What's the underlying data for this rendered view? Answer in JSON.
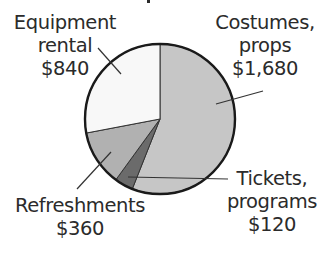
{
  "chart_data": {
    "type": "pie",
    "title": "",
    "total": 3000,
    "start_angle_deg": 0,
    "direction": "clockwise",
    "slices": [
      {
        "name": "Costumes, props",
        "value": 1680,
        "label_lines": [
          "Costumes,",
          "props",
          "$1,680"
        ],
        "color": "#c6c6c6"
      },
      {
        "name": "Tickets, programs",
        "value": 120,
        "label_lines": [
          "Tickets,",
          "programs",
          "$120"
        ],
        "color": "#6b6b6b"
      },
      {
        "name": "Refreshments",
        "value": 360,
        "label_lines": [
          "Refreshments",
          "$360"
        ],
        "color": "#b1b1b1"
      },
      {
        "name": "Equipment rental",
        "value": 840,
        "label_lines": [
          "Equipment",
          "rental",
          "$840"
        ],
        "color": "#f8f8f8"
      }
    ],
    "legend": "none (leader-line labels)",
    "grid": false
  },
  "labels": {
    "equipment": {
      "line1": "Equipment",
      "line2": "rental",
      "line3": "$840"
    },
    "costumes": {
      "line1": "Costumes,",
      "line2": "props",
      "line3": "$1,680"
    },
    "refreshments": {
      "line1": "Refreshments",
      "line2": "$360"
    },
    "tickets": {
      "line1": "Tickets,",
      "line2": "programs",
      "line3": "$120"
    }
  }
}
